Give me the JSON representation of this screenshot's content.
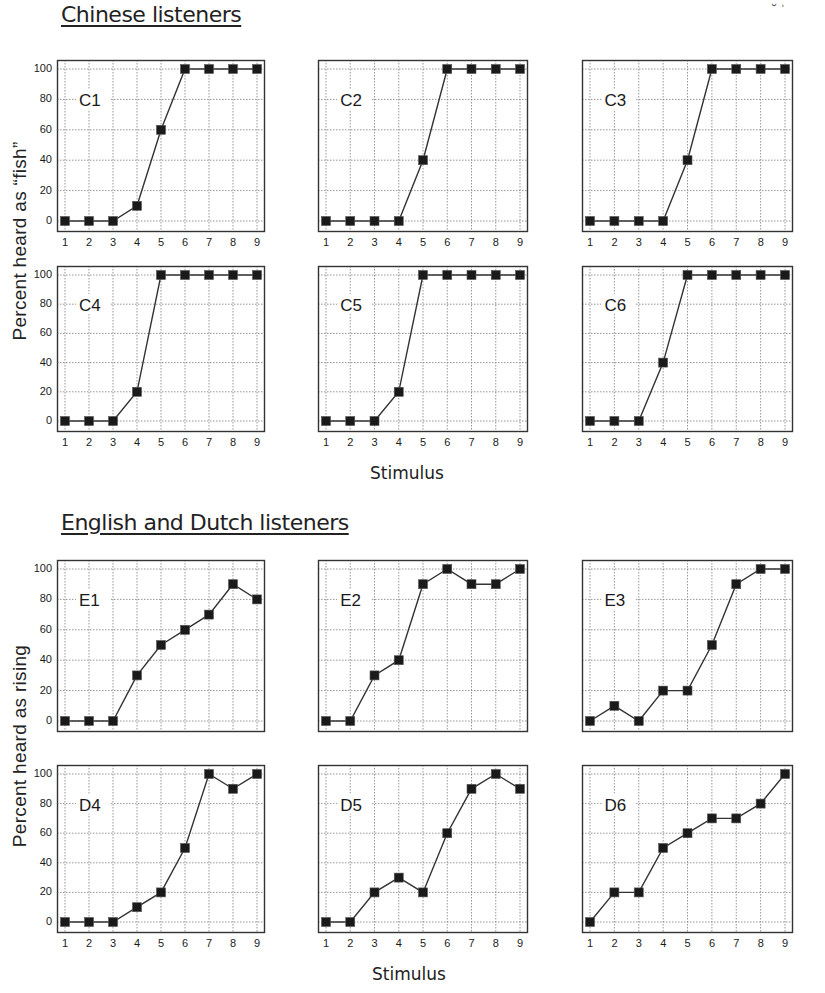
{
  "chart_data": [
    {
      "type": "line",
      "group": "Chinese listeners",
      "title": "C1",
      "categories": [
        1,
        2,
        3,
        4,
        5,
        6,
        7,
        8,
        9
      ],
      "values": [
        0,
        0,
        0,
        10,
        60,
        100,
        100,
        100,
        100
      ],
      "xlabel": "Stimulus",
      "ylabel": "Percent heard as \"fish\"",
      "ylim": [
        0,
        100
      ],
      "yticks": [
        0,
        20,
        40,
        60,
        80,
        100
      ],
      "grid": true,
      "marker": "square"
    },
    {
      "type": "line",
      "group": "Chinese listeners",
      "title": "C2",
      "categories": [
        1,
        2,
        3,
        4,
        5,
        6,
        7,
        8,
        9
      ],
      "values": [
        0,
        0,
        0,
        0,
        40,
        100,
        100,
        100,
        100
      ],
      "xlabel": "Stimulus",
      "ylabel": "Percent heard as \"fish\"",
      "ylim": [
        0,
        100
      ],
      "grid": true,
      "marker": "square"
    },
    {
      "type": "line",
      "group": "Chinese listeners",
      "title": "C3",
      "categories": [
        1,
        2,
        3,
        4,
        5,
        6,
        7,
        8,
        9
      ],
      "values": [
        0,
        0,
        0,
        0,
        40,
        100,
        100,
        100,
        100
      ],
      "xlabel": "Stimulus",
      "ylabel": "Percent heard as \"fish\"",
      "ylim": [
        0,
        100
      ],
      "grid": true,
      "marker": "square"
    },
    {
      "type": "line",
      "group": "Chinese listeners",
      "title": "C4",
      "categories": [
        1,
        2,
        3,
        4,
        5,
        6,
        7,
        8,
        9
      ],
      "values": [
        0,
        0,
        0,
        20,
        100,
        100,
        100,
        100,
        100
      ],
      "xlabel": "Stimulus",
      "ylabel": "Percent heard as \"fish\"",
      "ylim": [
        0,
        100
      ],
      "yticks": [
        0,
        20,
        40,
        60,
        80,
        100
      ],
      "grid": true,
      "marker": "square"
    },
    {
      "type": "line",
      "group": "Chinese listeners",
      "title": "C5",
      "categories": [
        1,
        2,
        3,
        4,
        5,
        6,
        7,
        8,
        9
      ],
      "values": [
        0,
        0,
        0,
        20,
        100,
        100,
        100,
        100,
        100
      ],
      "xlabel": "Stimulus",
      "ylabel": "Percent heard as \"fish\"",
      "ylim": [
        0,
        100
      ],
      "grid": true,
      "marker": "square"
    },
    {
      "type": "line",
      "group": "Chinese listeners",
      "title": "C6",
      "categories": [
        1,
        2,
        3,
        4,
        5,
        6,
        7,
        8,
        9
      ],
      "values": [
        0,
        0,
        0,
        40,
        100,
        100,
        100,
        100,
        100
      ],
      "xlabel": "Stimulus",
      "ylabel": "Percent heard as \"fish\"",
      "ylim": [
        0,
        100
      ],
      "grid": true,
      "marker": "square"
    },
    {
      "type": "line",
      "group": "English and Dutch listeners",
      "title": "E1",
      "categories": [
        1,
        2,
        3,
        4,
        5,
        6,
        7,
        8,
        9
      ],
      "values": [
        0,
        0,
        0,
        30,
        50,
        60,
        70,
        90,
        80
      ],
      "xlabel": "Stimulus",
      "ylabel": "Percent heard as rising",
      "ylim": [
        0,
        100
      ],
      "yticks": [
        0,
        20,
        40,
        60,
        80,
        100
      ],
      "grid": true,
      "marker": "square"
    },
    {
      "type": "line",
      "group": "English and Dutch listeners",
      "title": "E2",
      "categories": [
        1,
        2,
        3,
        4,
        5,
        6,
        7,
        8,
        9
      ],
      "values": [
        0,
        0,
        30,
        40,
        90,
        100,
        90,
        90,
        100
      ],
      "xlabel": "Stimulus",
      "ylabel": "Percent heard as rising",
      "ylim": [
        0,
        100
      ],
      "grid": true,
      "marker": "square"
    },
    {
      "type": "line",
      "group": "English and Dutch listeners",
      "title": "E3",
      "categories": [
        1,
        2,
        3,
        4,
        5,
        6,
        7,
        8,
        9
      ],
      "values": [
        0,
        10,
        0,
        20,
        20,
        50,
        90,
        100,
        100
      ],
      "xlabel": "Stimulus",
      "ylabel": "Percent heard as rising",
      "ylim": [
        0,
        100
      ],
      "grid": true,
      "marker": "square"
    },
    {
      "type": "line",
      "group": "English and Dutch listeners",
      "title": "D4",
      "categories": [
        1,
        2,
        3,
        4,
        5,
        6,
        7,
        8,
        9
      ],
      "values": [
        0,
        0,
        0,
        10,
        20,
        50,
        100,
        90,
        100
      ],
      "xlabel": "Stimulus",
      "ylabel": "Percent heard as rising",
      "ylim": [
        0,
        100
      ],
      "yticks": [
        0,
        20,
        40,
        60,
        80,
        100
      ],
      "grid": true,
      "marker": "square"
    },
    {
      "type": "line",
      "group": "English and Dutch listeners",
      "title": "D5",
      "categories": [
        1,
        2,
        3,
        4,
        5,
        6,
        7,
        8,
        9
      ],
      "values": [
        0,
        0,
        20,
        30,
        20,
        60,
        90,
        100,
        90
      ],
      "xlabel": "Stimulus",
      "ylabel": "Percent heard as rising",
      "ylim": [
        0,
        100
      ],
      "grid": true,
      "marker": "square"
    },
    {
      "type": "line",
      "group": "English and Dutch listeners",
      "title": "D6",
      "categories": [
        1,
        2,
        3,
        4,
        5,
        6,
        7,
        8,
        9
      ],
      "values": [
        0,
        20,
        20,
        50,
        60,
        70,
        70,
        80,
        100
      ],
      "xlabel": "Stimulus",
      "ylabel": "Percent heard as rising",
      "ylim": [
        0,
        100
      ],
      "grid": true,
      "marker": "square"
    }
  ],
  "sections": {
    "chinese": {
      "title": "Chinese listeners",
      "ylabel": "Percent heard as “fish”",
      "xlabel": "Stimulus"
    },
    "english_dutch": {
      "title": "English and Dutch listeners",
      "ylabel": "Percent heard as rising",
      "xlabel": "Stimulus"
    }
  },
  "axis": {
    "yticks": [
      "0",
      "20",
      "40",
      "60",
      "80",
      "100"
    ],
    "xticks": [
      "1",
      "2",
      "3",
      "4",
      "5",
      "6",
      "7",
      "8",
      "9"
    ]
  },
  "colors": {
    "line": "#333333",
    "marker": "#1a1a1a",
    "grid": "#8a8a8a",
    "frame": "#333333"
  }
}
